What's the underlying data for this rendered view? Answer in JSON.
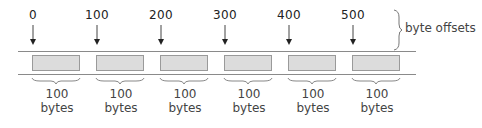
{
  "diagram": {
    "title": "",
    "offsets": [
      {
        "label": "0",
        "x": 33
      },
      {
        "label": "100",
        "x": 97
      },
      {
        "label": "200",
        "x": 161
      },
      {
        "label": "300",
        "x": 225
      },
      {
        "label": "400",
        "x": 289
      },
      {
        "label": "500",
        "x": 353
      }
    ],
    "offsets_brace_label": "byte offsets",
    "blocks": [
      {
        "size_value": "100",
        "size_unit": "bytes",
        "x": 32
      },
      {
        "size_value": "100",
        "size_unit": "bytes",
        "x": 96
      },
      {
        "size_value": "100",
        "size_unit": "bytes",
        "x": 160
      },
      {
        "size_value": "100",
        "size_unit": "bytes",
        "x": 224
      },
      {
        "size_value": "100",
        "size_unit": "bytes",
        "x": 288
      },
      {
        "size_value": "100",
        "size_unit": "bytes",
        "x": 352
      }
    ],
    "colors": {
      "block_fill": "#dcdcdc",
      "block_border": "#9a9a9a",
      "rail": "#8a8a8a",
      "arrow": "#222222",
      "text": "#333333"
    }
  }
}
